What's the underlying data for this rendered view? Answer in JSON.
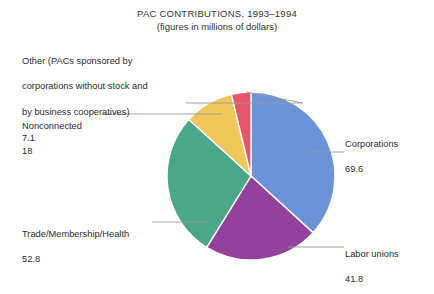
{
  "chart_data": {
    "type": "pie",
    "title": "PAC CONTRIBUTIONS, 1993–1994",
    "subtitle": "(figures in millions of dollars)",
    "xlabel": "",
    "ylabel": "",
    "units": "millions of dollars",
    "legend_position": "callout-labels",
    "grid": false,
    "total": 189.3,
    "categories": [
      "Corporations",
      "Labor unions",
      "Trade/Membership/Health",
      "Nonconnected",
      "Other (PACs sponsored by corporations without stock and by business cooperatives)"
    ],
    "values": [
      69.6,
      41.8,
      52.8,
      18,
      7.1
    ],
    "colors": [
      "#6b93d8",
      "#94419e",
      "#4aa888",
      "#f0c85a",
      "#e8556b"
    ],
    "slices": [
      {
        "label": "Corporations",
        "label_lines": [
          "Corporations"
        ],
        "value": 69.6,
        "value_text": "69.6",
        "color": "#6b93d8",
        "percent": 36.8,
        "start_angle_deg": 0,
        "sweep_deg": 132.4
      },
      {
        "label": "Labor unions",
        "label_lines": [
          "Labor unions"
        ],
        "value": 41.8,
        "value_text": "41.8",
        "color": "#94419e",
        "percent": 22.1,
        "start_angle_deg": 132.4,
        "sweep_deg": 79.5
      },
      {
        "label": "Trade/Membership/Health",
        "label_lines": [
          "Trade/Membership/Health"
        ],
        "value": 52.8,
        "value_text": "52.8",
        "color": "#4aa888",
        "percent": 27.9,
        "start_angle_deg": 211.9,
        "sweep_deg": 100.4
      },
      {
        "label": "Nonconnected",
        "label_lines": [
          "Nonconnected"
        ],
        "value": 18,
        "value_text": "18",
        "color": "#f0c85a",
        "percent": 9.5,
        "start_angle_deg": 312.3,
        "sweep_deg": 34.2
      },
      {
        "label": "Other (PACs sponsored by corporations without stock and by business cooperatives)",
        "label_lines": [
          "Other (PACs sponsored by",
          "corporations without stock and",
          "by business cooperatives)"
        ],
        "value": 7.1,
        "value_text": "7.1",
        "color": "#e8556b",
        "percent": 3.8,
        "start_angle_deg": 346.5,
        "sweep_deg": 13.5
      }
    ]
  },
  "callouts": {
    "other": {
      "line1": "Other (PACs sponsored by",
      "line2": "corporations without stock and",
      "line3": "by business cooperatives)",
      "value": "7.1"
    },
    "nonconnected": {
      "label": "Nonconnected",
      "value": "18"
    },
    "trade": {
      "label": "Trade/Membership/Health",
      "value": "52.8"
    },
    "corporations": {
      "label": "Corporations",
      "value": "69.6"
    },
    "labor": {
      "label": "Labor unions",
      "value": "41.8"
    }
  }
}
